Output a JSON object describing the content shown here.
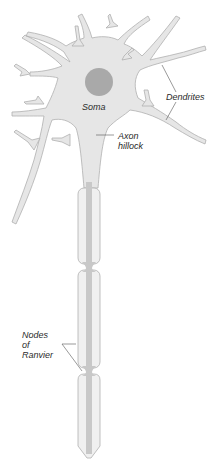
{
  "diagram": {
    "labels": {
      "soma": "Soma",
      "dendrites": "Dendrites",
      "axon_hillock_line1": "Axon",
      "axon_hillock_line2": "hillock",
      "nodes_line1": "Nodes",
      "nodes_line2": "of",
      "nodes_line3": "Ranvier"
    },
    "colors": {
      "cell_fill": "#e6e6e6",
      "cell_outline": "#b0b0b0",
      "nucleus": "#a9a9a9",
      "myelin_fill": "#f0f0f0",
      "axon_core": "#c8c8c8",
      "leader_line": "#555555",
      "label_text": "#2a2a2a"
    }
  }
}
